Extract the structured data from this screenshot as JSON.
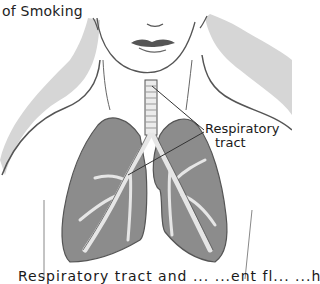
{
  "figure": {
    "title": "of Smoking",
    "labels": {
      "respiratory_tract_line1": "Respiratory",
      "respiratory_tract_line2": "tract"
    },
    "caption_partial": "Respiratory tract and ... ...ent fl... ...h"
  },
  "colors": {
    "lung_fill": "#8a8a8a",
    "shoulder_shade": "#d4d4d4",
    "line": "#444444",
    "airway": "#e8e8e8"
  }
}
